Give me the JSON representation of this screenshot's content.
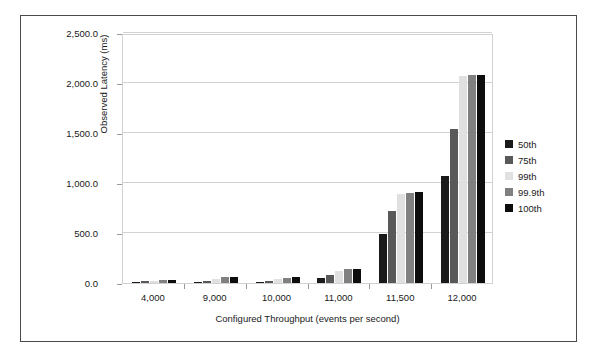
{
  "chart_data": {
    "type": "bar",
    "title": "",
    "xlabel": "Configured Throughput (events per second)",
    "ylabel": "Observed Latency (ms)",
    "categories": [
      "4,000",
      "9,000",
      "10,000",
      "11,000",
      "11,500",
      "12,000"
    ],
    "ylim": [
      0,
      2500
    ],
    "yticks": [
      0,
      500,
      1000,
      1500,
      2000,
      2500
    ],
    "ytick_labels": [
      "0.0",
      "500.0",
      "1,000.0",
      "1,500.0",
      "2,000.0",
      "2,500.0"
    ],
    "grid": true,
    "legend_position": "right",
    "series": [
      {
        "name": "50th",
        "color": "#1a1a1a",
        "values": [
          15,
          15,
          15,
          55,
          490,
          1070
        ]
      },
      {
        "name": "75th",
        "color": "#595959",
        "values": [
          20,
          25,
          25,
          80,
          720,
          1540
        ]
      },
      {
        "name": "99th",
        "color": "#e0e0e0",
        "values": [
          25,
          45,
          45,
          120,
          890,
          2075
        ]
      },
      {
        "name": "99.9th",
        "color": "#808080",
        "values": [
          30,
          60,
          55,
          140,
          905,
          2085
        ]
      },
      {
        "name": "100th",
        "color": "#0d0d0d",
        "values": [
          35,
          65,
          60,
          145,
          910,
          2085
        ]
      }
    ]
  }
}
